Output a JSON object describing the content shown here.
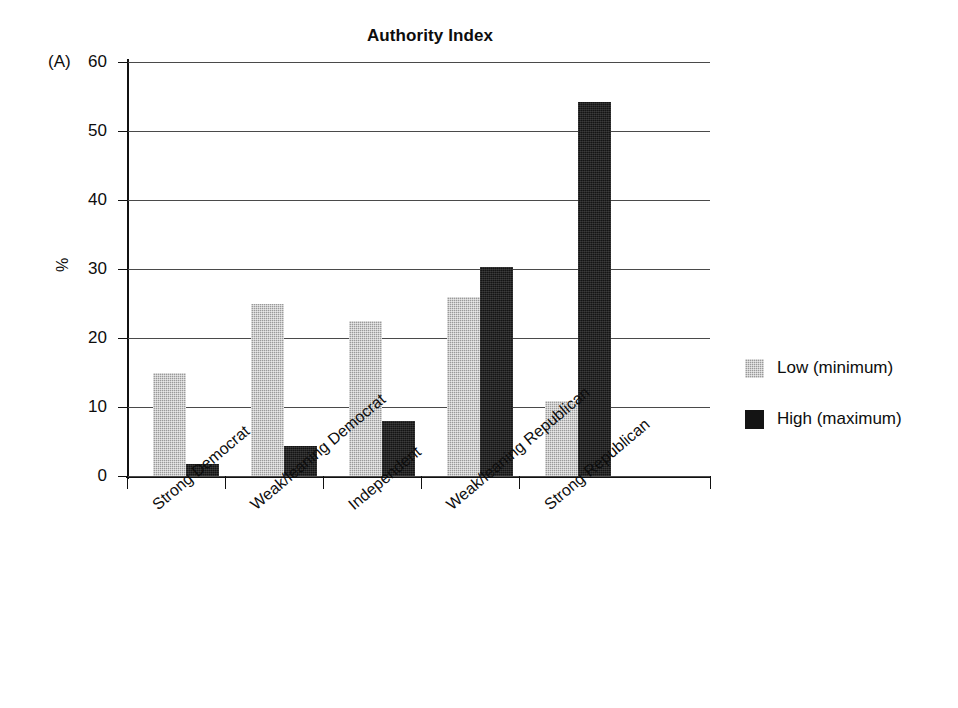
{
  "chart_data": {
    "type": "bar",
    "title": "Authority Index",
    "panel_label": "(A)",
    "xlabel": "",
    "ylabel": "%",
    "ylim": [
      0,
      60
    ],
    "yticks": [
      0,
      10,
      20,
      30,
      40,
      50,
      60
    ],
    "ytick_labels": [
      "0",
      "10",
      "20",
      "30",
      "40",
      "50",
      "60"
    ],
    "grid": true,
    "legend_position": "right",
    "categories": [
      "Strong Democrat",
      "Weak/leaning Democrat",
      "Independent",
      "Weak/leaning Republican",
      "Strong Republican"
    ],
    "series": [
      {
        "name": "Low (minimum)",
        "color": "#9a9a9a",
        "values": [
          15.0,
          24.9,
          22.5,
          25.9,
          10.8
        ]
      },
      {
        "name": "High (maximum)",
        "color": "#141414",
        "values": [
          1.7,
          4.3,
          8.0,
          30.3,
          54.2
        ]
      }
    ]
  },
  "legend": {
    "items": [
      {
        "label": "Low (minimum)",
        "swatch": "low"
      },
      {
        "label": "High (maximum)",
        "swatch": "high"
      }
    ]
  }
}
